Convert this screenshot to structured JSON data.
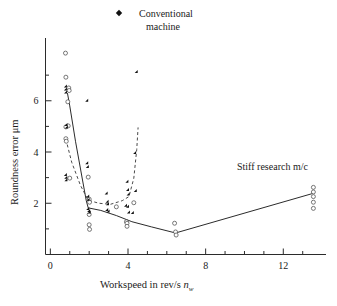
{
  "figure": {
    "background": "#ffffff",
    "width": 337,
    "height": 306
  },
  "legend": {
    "position": "top-center",
    "entries": [
      {
        "label_line1": "Conventional",
        "label_line2": "machine",
        "marker": "filled-diamond",
        "color": "#111111"
      }
    ]
  },
  "annotations": [
    {
      "name": "stiff-research-label",
      "text": "Stiff research m/c",
      "x_px": 237,
      "y_px": 170
    }
  ],
  "axes": {
    "x": {
      "title_main": "Workspeed in rev/s ",
      "title_var": "n",
      "title_sub": "w",
      "ticks_major": [
        0,
        4,
        8,
        12
      ],
      "ticks_minor": [
        1,
        2,
        3,
        5,
        6,
        7,
        9,
        10,
        11,
        13
      ],
      "range": [
        -0.25,
        14.2
      ],
      "tick_labels": [
        "0",
        "4",
        "8",
        "12"
      ]
    },
    "y": {
      "title": "Roundness error μm",
      "ticks_major": [
        2,
        4,
        6
      ],
      "ticks_minor": [
        1,
        3,
        5,
        7
      ],
      "range": [
        0,
        8.45
      ],
      "tick_labels": [
        "2",
        "4",
        "6"
      ]
    },
    "grid": false
  },
  "chart_data": {
    "type": "scatter",
    "title": "",
    "subtitle": "",
    "xlabel": "Workspeed in rev/s n_w",
    "ylabel": "Roundness error μm",
    "xlim": [
      -0.25,
      14.2
    ],
    "ylim": [
      0,
      8.45
    ],
    "grid": false,
    "legend_position": "top-center",
    "series": [
      {
        "name": "Conventional machine",
        "marker": "filled-diamond",
        "color": "#111111",
        "points": [
          [
            0.85,
            6.52
          ],
          [
            0.85,
            6.4
          ],
          [
            0.86,
            6.28
          ],
          [
            0.88,
            5.02
          ],
          [
            0.9,
            4.92
          ],
          [
            0.85,
            3.06
          ],
          [
            0.87,
            2.96
          ],
          [
            0.88,
            2.86
          ],
          [
            1.95,
            5.96
          ],
          [
            1.95,
            3.52
          ],
          [
            1.98,
            3.38
          ],
          [
            2.0,
            2.22
          ],
          [
            2.02,
            2.1
          ],
          [
            2.0,
            1.74
          ],
          [
            2.05,
            1.66
          ],
          [
            2.08,
            1.6
          ],
          [
            2.95,
            2.34
          ],
          [
            3.0,
            2.02
          ],
          [
            3.02,
            1.92
          ],
          [
            2.98,
            1.7
          ],
          [
            3.05,
            1.64
          ],
          [
            3.95,
            1.86
          ],
          [
            4.05,
            1.82
          ],
          [
            4.02,
            2.8
          ],
          [
            4.05,
            2.48
          ],
          [
            4.08,
            2.3
          ],
          [
            4.1,
            1.6
          ],
          [
            4.3,
            1.58
          ],
          [
            4.45,
            2.44
          ],
          [
            4.42,
            3.92
          ],
          [
            4.5,
            7.08
          ]
        ]
      },
      {
        "name": "Stiff research m/c",
        "marker": "open-circle",
        "color": "#555555",
        "points": [
          [
            0.78,
            7.86
          ],
          [
            0.8,
            6.92
          ],
          [
            0.95,
            6.5
          ],
          [
            0.97,
            6.4
          ],
          [
            0.9,
            5.96
          ],
          [
            0.92,
            5.02
          ],
          [
            0.8,
            4.98
          ],
          [
            0.8,
            4.52
          ],
          [
            0.82,
            4.42
          ],
          [
            1.0,
            2.98
          ],
          [
            1.95,
            3.02
          ],
          [
            2.0,
            2.16
          ],
          [
            2.02,
            2.04
          ],
          [
            2.0,
            1.56
          ],
          [
            2.0,
            1.16
          ],
          [
            2.02,
            0.98
          ],
          [
            3.4,
            1.86
          ],
          [
            3.92,
            1.28
          ],
          [
            3.95,
            1.22
          ],
          [
            3.95,
            1.1
          ],
          [
            4.3,
            2.02
          ],
          [
            6.4,
            1.22
          ],
          [
            6.45,
            0.88
          ],
          [
            6.48,
            0.76
          ],
          [
            13.55,
            2.62
          ],
          [
            13.55,
            2.44
          ],
          [
            13.55,
            2.26
          ],
          [
            13.55,
            2.04
          ],
          [
            13.55,
            1.8
          ]
        ]
      }
    ],
    "trend_lines": [
      {
        "name": "stiff-research-trend",
        "style": "solid",
        "color": "#2b2b2b",
        "points": [
          [
            0.88,
            6.3
          ],
          [
            1.0,
            5.8
          ],
          [
            1.3,
            4.4
          ],
          [
            1.85,
            2.1
          ],
          [
            1.95,
            1.82
          ],
          [
            2.6,
            1.72
          ],
          [
            3.4,
            1.52
          ],
          [
            4.2,
            1.28
          ],
          [
            5.2,
            1.08
          ],
          [
            6.45,
            0.84
          ],
          [
            13.6,
            2.4
          ]
        ]
      },
      {
        "name": "conventional-trend",
        "style": "dashed",
        "color": "#4a4a4a",
        "points": [
          [
            0.8,
            4.5
          ],
          [
            1.1,
            3.6
          ],
          [
            1.55,
            2.7
          ],
          [
            1.95,
            2.12
          ],
          [
            2.5,
            2.0
          ],
          [
            3.1,
            1.96
          ],
          [
            3.7,
            2.1
          ],
          [
            4.05,
            2.26
          ],
          [
            4.3,
            2.98
          ],
          [
            4.45,
            4.1
          ],
          [
            4.52,
            4.96
          ]
        ]
      }
    ]
  }
}
